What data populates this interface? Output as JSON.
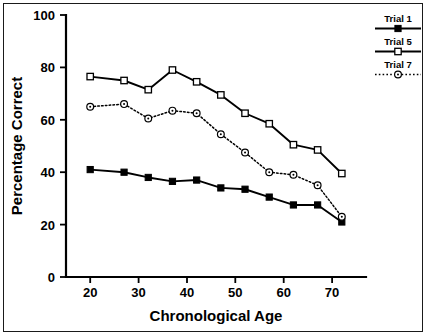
{
  "figure": {
    "border_color": "#1a1a1a",
    "background": "#ffffff"
  },
  "chart_data": {
    "type": "line",
    "title": "",
    "xlabel": "Chronological Age",
    "ylabel": "Percentage Correct",
    "xlim": [
      15,
      77
    ],
    "ylim": [
      0,
      100
    ],
    "xticks": [
      20,
      30,
      40,
      50,
      60,
      70
    ],
    "xtick_labels": [
      "20",
      "30",
      "40",
      "50",
      "60",
      "70"
    ],
    "yticks": [
      0,
      20,
      40,
      60,
      80,
      100
    ],
    "ytick_labels": [
      "0",
      "20",
      "40",
      "60",
      "80",
      "100"
    ],
    "grid": false,
    "legend_position": "outside-right-top",
    "x": [
      20,
      27,
      32,
      37,
      42,
      47,
      52,
      57,
      62,
      67,
      72
    ],
    "series": [
      {
        "name": "Trial 1",
        "marker": "filled-square",
        "linestyle": "solid",
        "color": "#000000",
        "values": [
          41,
          40,
          38,
          36.5,
          37,
          34,
          33.5,
          30.5,
          27.5,
          27.5,
          21
        ]
      },
      {
        "name": "Trial 5",
        "marker": "open-square",
        "linestyle": "solid",
        "color": "#000000",
        "values": [
          76.5,
          75,
          71.5,
          79,
          74.5,
          69.5,
          62.5,
          58.5,
          50.5,
          48.5,
          39.5
        ]
      },
      {
        "name": "Trial 7",
        "marker": "dot-circle",
        "linestyle": "dotted",
        "color": "#000000",
        "values": [
          65,
          66,
          60.5,
          63.5,
          62.5,
          54.5,
          47.5,
          40,
          39,
          35,
          23
        ]
      }
    ]
  },
  "legend": {
    "items": [
      {
        "label": "Trial 1"
      },
      {
        "label": "Trial 5"
      },
      {
        "label": "Trial 7"
      }
    ]
  }
}
